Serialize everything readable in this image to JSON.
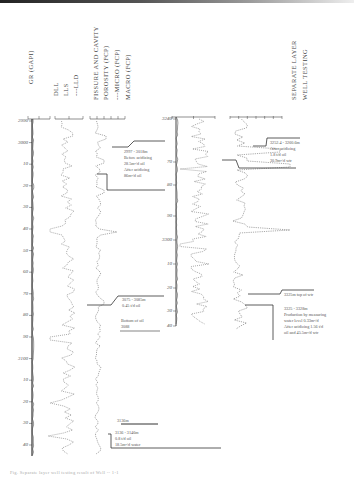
{
  "figure": {
    "track_headers": {
      "gr": "GR (GAPI)",
      "dll": "DLL",
      "lls": "LLS",
      "lld": "---LLD",
      "fcp_title_1": "FISSURE AND CAVITY",
      "fcp_title_2": "POROSITY   (FCP)",
      "micro": "---MICRO (FCP)",
      "macro": "MACRO (FCP)",
      "swt_1": "SEPARATE LAYER",
      "swt_2": "WELL   TESTING"
    },
    "scales": {
      "gr": [
        "0",
        "90",
        "150"
      ],
      "dll": [
        "1",
        "10",
        "1e4"
      ],
      "fcp": [
        "0",
        "2",
        "4",
        "6",
        "8",
        "10"
      ],
      "gr2": [
        "0",
        "90",
        "150"
      ],
      "fcp2": [
        "0",
        "2",
        "4",
        "6",
        "8",
        "10",
        "12"
      ]
    },
    "depth_ticks_left": [
      "2990",
      "3000",
      "10",
      "20",
      "30",
      "40",
      "50",
      "60",
      "70",
      "80",
      "90",
      "3100",
      "10",
      "20",
      "30",
      "40"
    ],
    "depth_ticks_right": [
      "3240",
      "70",
      "80",
      "90",
      "3300",
      "10",
      "20",
      "30",
      "40"
    ],
    "annotations": {
      "test1": [
        "2997 - 3018m",
        "Before acidizing",
        "28.5m³/d oil",
        "After acidizing",
        "86m³/d oil"
      ],
      "test2": [
        "3075 - 3085m",
        "0.45 t/d oil"
      ],
      "test2_bottom": [
        "Bottom of oil",
        "3088"
      ],
      "test3": [
        "3136 - 3146m",
        "0.8 t/d oil",
        "18.5m³/d water"
      ],
      "test3_top": [
        "3136m"
      ],
      "test4": [
        "3252.4 - 3260.6m",
        "After acidizing",
        "1.8 t/d oil",
        "30.9m³/d wtr"
      ],
      "test5_top": [
        "3325m top of wtr"
      ],
      "test5": [
        "3325 - 3328m",
        "Production by measuring",
        "water level 0.33m³/d",
        "After acidizing 1.56 t/d",
        "oil and 45.5m³/d wtr"
      ]
    },
    "caption": "Fig. Separate layer well testing result of Well -- 1-1"
  },
  "chart_data": {
    "type": "line",
    "xlabel": "",
    "ylabel": "Depth (m)",
    "intervals": [
      {
        "name": "upper",
        "ylim": [
          2990,
          3146
        ]
      },
      {
        "name": "lower",
        "ylim": [
          3240,
          3340
        ]
      }
    ],
    "series": [
      {
        "name": "GR (GAPI)",
        "track": 1
      },
      {
        "name": "DLL / LLS / LLD",
        "track": 2
      },
      {
        "name": "MICRO (FCP)",
        "track": 3
      },
      {
        "name": "MACRO (FCP)",
        "track": 3
      }
    ]
  }
}
